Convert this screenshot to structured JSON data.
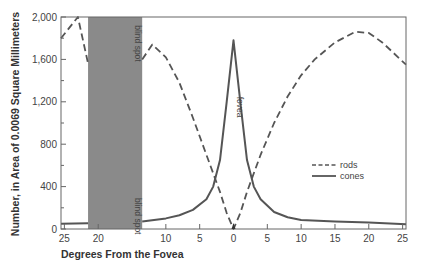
{
  "chart_data": {
    "type": "line",
    "title": "",
    "xlabel": "Degrees From the Fovea",
    "ylabel": "Number, in Area of 0.0069 Square Millimeters",
    "x_tick_labels": [
      "25",
      "20",
      "10",
      "5",
      "0",
      "5",
      "10",
      "15",
      "20",
      "25"
    ],
    "x_tick_positions": [
      -25,
      -20,
      -10,
      -5,
      0,
      5,
      10,
      15,
      20,
      25
    ],
    "y_tick_labels": [
      "0",
      "400",
      "800",
      "1,200",
      "1,600",
      "2,000"
    ],
    "y_ticks": [
      0,
      400,
      800,
      1200,
      1600,
      2000
    ],
    "ylim": [
      0,
      2000
    ],
    "xlim": [
      -25.5,
      25.5
    ],
    "grid": false,
    "legend_position": "right, middle",
    "annotations": [
      {
        "text": "blind spot",
        "x": -15,
        "y": 1750,
        "rotation": 90
      },
      {
        "text": "blind spot",
        "x": -15,
        "y": 120,
        "rotation": 90
      },
      {
        "text": "fovea",
        "x": 0,
        "y": 1150,
        "rotation": 90
      }
    ],
    "shaded_regions": [
      {
        "label": "blind spot",
        "x_start": -21.5,
        "x_end": -13.5,
        "color": "#8a8a8a"
      }
    ],
    "series": [
      {
        "name": "rods",
        "style": "dashed",
        "segments": [
          {
            "x": [
              -25.5,
              -23,
              -21.5
            ],
            "y": [
              1800,
              2000,
              1560
            ]
          },
          {
            "x": [
              -13.5,
              -12,
              -10,
              -8,
              -6,
              -4,
              -2,
              -1,
              0,
              1,
              2,
              4,
              6,
              8,
              10,
              12,
              15,
              18,
              20,
              22,
              25.5
            ],
            "y": [
              1600,
              1740,
              1620,
              1380,
              1050,
              700,
              350,
              150,
              0,
              150,
              350,
              700,
              1000,
              1250,
              1450,
              1600,
              1760,
              1860,
              1850,
              1760,
              1550
            ]
          }
        ]
      },
      {
        "name": "cones",
        "style": "solid",
        "segments": [
          {
            "x": [
              -25.5,
              -21.5
            ],
            "y": [
              50,
              55
            ]
          },
          {
            "x": [
              -13.5,
              -10,
              -8,
              -6,
              -4,
              -3,
              -2,
              -1,
              0,
              1,
              2,
              3,
              4,
              6,
              8,
              10,
              15,
              20,
              25.5
            ],
            "y": [
              70,
              100,
              130,
              180,
              280,
              400,
              650,
              1200,
              1780,
              1200,
              650,
              400,
              280,
              160,
              110,
              85,
              70,
              60,
              45
            ]
          }
        ]
      }
    ]
  },
  "legend": {
    "items": [
      {
        "label": "rods",
        "style": "dashed"
      },
      {
        "label": "cones",
        "style": "solid"
      }
    ]
  },
  "colors": {
    "line": "#555555",
    "axis": "#666666",
    "blind_spot": "#8a8a8a"
  }
}
